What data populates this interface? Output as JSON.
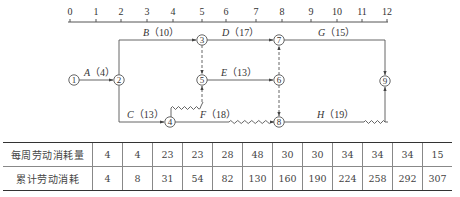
{
  "axis": {
    "ticks": [
      "0",
      "1",
      "2",
      "3",
      "4",
      "5",
      "6",
      "7",
      "8",
      "9",
      "10",
      "11",
      "12"
    ]
  },
  "nodes": [
    "1",
    "2",
    "3",
    "4",
    "5",
    "6",
    "7",
    "8",
    "9"
  ],
  "activities": [
    {
      "id": "A",
      "letter": "A",
      "duration": "（4）"
    },
    {
      "id": "B",
      "letter": "B",
      "duration": "（10）"
    },
    {
      "id": "C",
      "letter": "C",
      "duration": "（13）"
    },
    {
      "id": "D",
      "letter": "D",
      "duration": "（17）"
    },
    {
      "id": "E",
      "letter": "E",
      "duration": "（13）"
    },
    {
      "id": "F",
      "letter": "F",
      "duration": "（18）"
    },
    {
      "id": "G",
      "letter": "G",
      "duration": "（15）"
    },
    {
      "id": "H",
      "letter": "H",
      "duration": "（19）"
    }
  ],
  "table": {
    "rows": [
      {
        "label": "每周劳动消耗量",
        "values": [
          "4",
          "4",
          "23",
          "23",
          "28",
          "48",
          "30",
          "30",
          "34",
          "34",
          "34",
          "15"
        ]
      },
      {
        "label": "累计劳动消耗",
        "values": [
          "4",
          "8",
          "31",
          "54",
          "82",
          "130",
          "160",
          "190",
          "224",
          "258",
          "292",
          "307"
        ]
      }
    ]
  },
  "colors": {
    "line": "#555555",
    "text": "#333333",
    "background": "#ffffff"
  }
}
